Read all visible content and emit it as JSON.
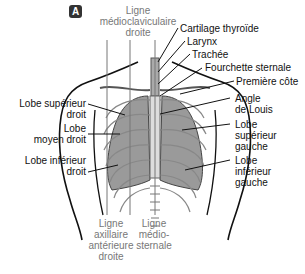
{
  "figure": {
    "badge": "A",
    "labels": {
      "ligne_medioclaviculaire_droite": [
        "Ligne",
        "médioclaviculaire",
        "droite"
      ],
      "cartilage_thyroide": "Cartilage thyroïde",
      "larynx": "Larynx",
      "trachee": "Trachée",
      "fourchette_sternale": "Fourchette sternale",
      "premiere_cote": "Première côte",
      "angle_de_louis": [
        "Angle",
        "de Louis"
      ],
      "lobe_superieur_gauche": [
        "Lobe",
        "supérieur",
        "gauche"
      ],
      "lobe_inferieur_gauche": [
        "Lobe",
        "inférieur",
        "gauche"
      ],
      "lobe_superieur_droit": [
        "Lobe supérieur",
        "droit"
      ],
      "lobe_moyen_droit": [
        "Lobe",
        "moyen droit"
      ],
      "lobe_inferieur_droit": [
        "Lobe inférieur",
        "droit"
      ],
      "ligne_axillaire_anterieure_droite": [
        "Ligne",
        "axillaire",
        "antérieure",
        "droite"
      ],
      "ligne_mediosternale": [
        "Ligne",
        "médio-",
        "sternale"
      ]
    }
  }
}
